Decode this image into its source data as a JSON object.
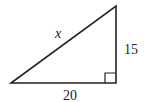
{
  "diagram": {
    "type": "right-triangle",
    "labels": {
      "hypotenuse": "x",
      "vertical_leg": "15",
      "horizontal_leg": "20"
    },
    "colors": {
      "stroke": "#222222",
      "background": "#ffffff"
    }
  }
}
